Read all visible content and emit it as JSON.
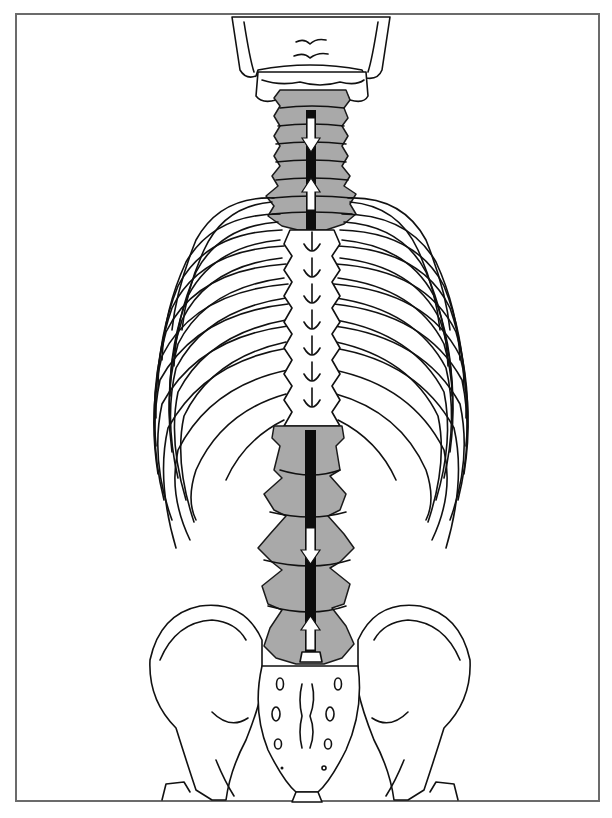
{
  "figure": {
    "highlighted_regions": [
      "cervical-spine",
      "lumbar-spine"
    ],
    "arrows": [
      {
        "region": "cervical",
        "direction": "down"
      },
      {
        "region": "cervical",
        "direction": "up"
      },
      {
        "region": "lumbar",
        "direction": "down"
      },
      {
        "region": "lumbar",
        "direction": "up"
      }
    ],
    "colors": {
      "frame": "#6b6b6b",
      "line": "#111111",
      "highlight": "#a9a9a9",
      "canal": "#0d0d0d",
      "background": "#ffffff"
    }
  }
}
